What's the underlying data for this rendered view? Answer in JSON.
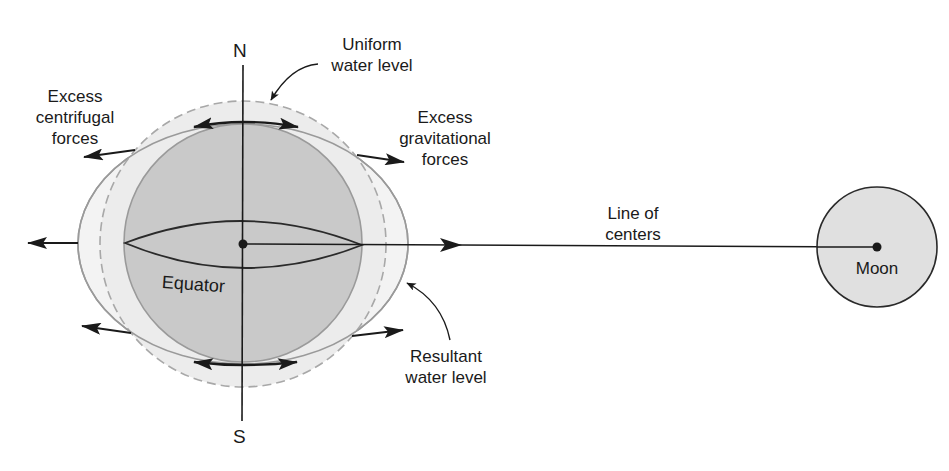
{
  "diagram": {
    "colors": {
      "earth_fill": "#c9c9c9",
      "water_fill": "#ececec",
      "moon_fill": "#e0e0e0",
      "outline": "#9a9a9a",
      "ink": "#1a1a1a",
      "dashed": "#a8a8a8",
      "background": "#ffffff"
    },
    "labels": {
      "north": "N",
      "south": "S",
      "equator": "Equator",
      "moon": "Moon",
      "uniform_water_level": [
        "Uniform",
        "water level"
      ],
      "excess_centrifugal": [
        "Excess",
        "centrifugal",
        "forces"
      ],
      "excess_gravitational": [
        "Excess",
        "gravitational",
        "forces"
      ],
      "line_of_centers": [
        "Line of",
        "centers"
      ],
      "resultant_water_level": [
        "Resultant",
        "water level"
      ]
    },
    "elements": [
      {
        "name": "earth",
        "shape": "circle",
        "description": "Solid Earth, shaded gray"
      },
      {
        "name": "uniform-water-level",
        "shape": "dashed circle",
        "description": "Water level without tidal forces"
      },
      {
        "name": "resultant-water-level",
        "shape": "ellipse",
        "description": "Water level elongated along line of centers"
      },
      {
        "name": "line-of-centers",
        "shape": "line",
        "description": "Line connecting Earth center to Moon center"
      },
      {
        "name": "moon",
        "shape": "circle",
        "description": "The Moon"
      }
    ]
  }
}
